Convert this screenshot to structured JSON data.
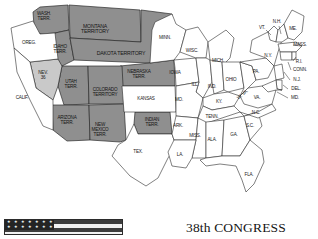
{
  "figure": {
    "title": "38th CONGRESS",
    "kind": "historical-us-map"
  },
  "colors": {
    "territory_fill": "#8f8f8f",
    "state_fill": "#ffffff",
    "nevada_fill": "#c9c9c9",
    "outline": "#2b2b2b",
    "text": "#1a1a1a",
    "legend_dark": "#3d3d3d",
    "legend_light": "#f2f2f2",
    "legend_canton": "#242424"
  },
  "legend": {
    "star_count": 7,
    "star_glyph": "★",
    "stripe_count": 4
  },
  "map": {
    "territories": [
      {
        "id": "wash-terr",
        "label": "WASH.\nTERR.",
        "x": 44,
        "y": 17,
        "size": "sm"
      },
      {
        "id": "montana-terr",
        "label": "MONTANA\nTERRITORY",
        "x": 95,
        "y": 29,
        "size": "md"
      },
      {
        "id": "idaho-terr",
        "label": "IDAHO\nTERR.",
        "x": 60,
        "y": 50,
        "size": "sm"
      },
      {
        "id": "dakota-terr",
        "label": "DAKOTA TERRITORY",
        "x": 121,
        "y": 54,
        "size": "md"
      },
      {
        "id": "nebraska-terr",
        "label": "NEBRASKA\nTERR.",
        "x": 139,
        "y": 75,
        "size": "sm"
      },
      {
        "id": "utah-terr",
        "label": "UTAH\nTERR.",
        "x": 71,
        "y": 85,
        "size": "sm"
      },
      {
        "id": "colorado-terr",
        "label": "COLORADO\nTERRITORY",
        "x": 105,
        "y": 93,
        "size": "sm"
      },
      {
        "id": "arizona-terr",
        "label": "ARIZONA\nTERR.",
        "x": 67,
        "y": 121,
        "size": "sm"
      },
      {
        "id": "newmexico-terr",
        "label": "NEW\nMEXICO\nTERR.",
        "x": 100,
        "y": 130,
        "size": "sm"
      },
      {
        "id": "indian-terr",
        "label": "INDIAN\nTERR.",
        "x": 152,
        "y": 123,
        "size": "sm"
      }
    ],
    "special": [
      {
        "id": "nevada",
        "label": "NEV.",
        "sub": "36",
        "x": 43,
        "y": 76,
        "size": "sm"
      }
    ],
    "states": [
      {
        "id": "oregon",
        "label": "OREG.",
        "x": 29,
        "y": 43,
        "size": "sm"
      },
      {
        "id": "california",
        "label": "CALIF.",
        "x": 22,
        "y": 98,
        "size": "sm"
      },
      {
        "id": "kansas",
        "label": "KANSAS",
        "x": 146,
        "y": 99,
        "size": "sm"
      },
      {
        "id": "texas",
        "label": "TEX.",
        "x": 138,
        "y": 152,
        "size": "sm"
      },
      {
        "id": "minnesota",
        "label": "MINN.",
        "x": 165,
        "y": 38,
        "size": "sm"
      },
      {
        "id": "wisconsin",
        "label": "WISC.",
        "x": 192,
        "y": 51,
        "size": "sm"
      },
      {
        "id": "iowa",
        "label": "IOWA",
        "x": 175,
        "y": 73,
        "size": "sm"
      },
      {
        "id": "michigan",
        "label": "MICH.",
        "x": 218,
        "y": 61,
        "size": "sm"
      },
      {
        "id": "illinois",
        "label": "ILL.",
        "x": 195,
        "y": 85,
        "size": "sm"
      },
      {
        "id": "indiana",
        "label": "IND.",
        "x": 212,
        "y": 87,
        "size": "sm"
      },
      {
        "id": "ohio",
        "label": "OHIO",
        "x": 231,
        "y": 80,
        "size": "sm"
      },
      {
        "id": "missouri",
        "label": "MO.",
        "x": 179,
        "y": 100,
        "size": "sm"
      },
      {
        "id": "kentucky",
        "label": "KY.",
        "x": 219,
        "y": 102,
        "size": "sm"
      },
      {
        "id": "tennessee",
        "label": "TENN.",
        "x": 212,
        "y": 117,
        "size": "sm"
      },
      {
        "id": "arkansas",
        "label": "ARK.",
        "x": 178,
        "y": 126,
        "size": "sm"
      },
      {
        "id": "mississippi",
        "label": "MISS.",
        "x": 195,
        "y": 136,
        "size": "sm"
      },
      {
        "id": "louisiana",
        "label": "LA.",
        "x": 180,
        "y": 155,
        "size": "sm"
      },
      {
        "id": "alabama",
        "label": "ALA.",
        "x": 212,
        "y": 140,
        "size": "sm"
      },
      {
        "id": "georgia",
        "label": "GA.",
        "x": 234,
        "y": 135,
        "size": "sm"
      },
      {
        "id": "florida",
        "label": "FLA.",
        "x": 249,
        "y": 175,
        "size": "sm"
      },
      {
        "id": "south-carolina",
        "label": "S.C.",
        "x": 250,
        "y": 126,
        "size": "sm"
      },
      {
        "id": "north-carolina",
        "label": "N.C.",
        "x": 256,
        "y": 113,
        "size": "sm"
      },
      {
        "id": "virginia",
        "label": "VA.",
        "x": 257,
        "y": 98,
        "size": "sm"
      },
      {
        "id": "west-virginia",
        "label": "W. VA.",
        "x": 243,
        "y": 95,
        "size": "sm",
        "rotate": -40
      },
      {
        "id": "pennsylvania",
        "label": "PA.",
        "x": 256,
        "y": 72,
        "size": "sm"
      },
      {
        "id": "new-york",
        "label": "N.Y.",
        "x": 268,
        "y": 56,
        "size": "sm"
      },
      {
        "id": "vermont",
        "label": "VT.",
        "x": 262,
        "y": 28,
        "size": "sm"
      },
      {
        "id": "new-hampshire",
        "label": "N.H.",
        "x": 277,
        "y": 22,
        "size": "sm"
      },
      {
        "id": "maine",
        "label": "ME.",
        "x": 293,
        "y": 29,
        "size": "sm"
      },
      {
        "id": "massachusetts",
        "label": "MASS.",
        "x": 300,
        "y": 45,
        "size": "sm"
      },
      {
        "id": "rhode-island",
        "label": "R.I.",
        "x": 299,
        "y": 62,
        "size": "sm"
      },
      {
        "id": "connecticut",
        "label": "CONN.",
        "x": 300,
        "y": 70,
        "size": "sm"
      },
      {
        "id": "new-jersey",
        "label": "N.J.",
        "x": 297,
        "y": 80,
        "size": "sm"
      },
      {
        "id": "delaware",
        "label": "DEL.",
        "x": 296,
        "y": 89,
        "size": "sm"
      },
      {
        "id": "maryland",
        "label": "MD.",
        "x": 295,
        "y": 98,
        "size": "sm"
      }
    ]
  }
}
